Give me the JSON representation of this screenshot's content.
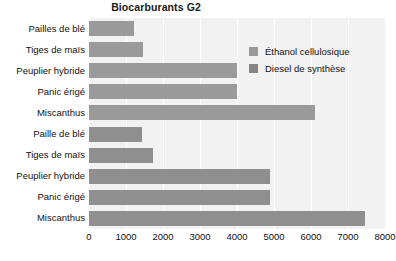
{
  "chart_data": {
    "type": "bar",
    "orientation": "horizontal",
    "title": "Biocarburants G2",
    "xlabel": "",
    "ylabel": "",
    "xlim": [
      0,
      8000
    ],
    "xticks": [
      0,
      1000,
      2000,
      3000,
      4000,
      5000,
      6000,
      7000,
      8000
    ],
    "xtick_labels": [
      "0",
      "1000",
      "2000",
      "3000",
      "4000",
      "5000",
      "6000",
      "7000",
      "8000"
    ],
    "grid": true,
    "grid_axis": "x",
    "legend_position": "upper right inside plot",
    "plot_background": "#f2f2f2",
    "categories": [
      "Pailles de blé",
      "Tiges de maïs",
      "Peuplier hybride",
      "Panic érigé",
      "Miscanthus",
      "Paille de blé",
      "Tiges de maïs",
      "Peuplier hybride",
      "Panic érigé",
      "Miscanthus"
    ],
    "series": [
      {
        "name": "Éthanol cellulosique",
        "color": "#9a9a9a",
        "values": [
          1220,
          1450,
          4000,
          4000,
          6100,
          null,
          null,
          null,
          null,
          null
        ]
      },
      {
        "name": "Diesel de synthèse",
        "color": "#8f8f8f",
        "values": [
          null,
          null,
          null,
          null,
          null,
          1420,
          1720,
          4900,
          4900,
          7450
        ]
      }
    ],
    "bars": [
      {
        "category": "Pailles de blé",
        "series": "Éthanol cellulosique",
        "value": 1220
      },
      {
        "category": "Tiges de maïs",
        "series": "Éthanol cellulosique",
        "value": 1450
      },
      {
        "category": "Peuplier hybride",
        "series": "Éthanol cellulosique",
        "value": 4000
      },
      {
        "category": "Panic érigé",
        "series": "Éthanol cellulosique",
        "value": 4000
      },
      {
        "category": "Miscanthus",
        "series": "Éthanol cellulosique",
        "value": 6100
      },
      {
        "category": "Paille de blé",
        "series": "Diesel de synthèse",
        "value": 1420
      },
      {
        "category": "Tiges de maïs",
        "series": "Diesel de synthèse",
        "value": 1720
      },
      {
        "category": "Peuplier hybride",
        "series": "Diesel de synthèse",
        "value": 4900
      },
      {
        "category": "Panic érigé",
        "series": "Diesel de synthèse",
        "value": 4900
      },
      {
        "category": "Miscanthus",
        "series": "Diesel de synthèse",
        "value": 7450
      }
    ]
  },
  "legend": {
    "items": [
      {
        "label": "Éthanol cellulosique",
        "swatch": "ethanol"
      },
      {
        "label": "Diesel de synthèse",
        "swatch": "diesel"
      }
    ]
  }
}
